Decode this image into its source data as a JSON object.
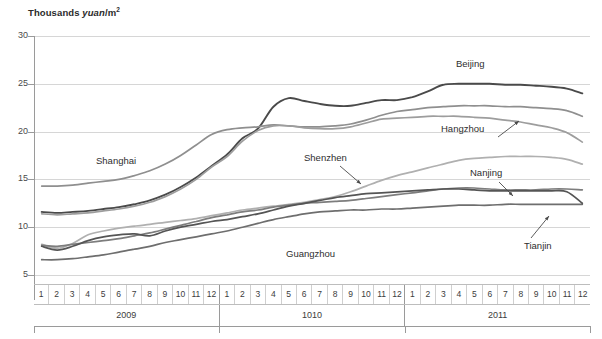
{
  "chart_data": {
    "type": "line",
    "title_parts": {
      "lead": "Thousands ",
      "italic": "yuan",
      "tail": "/m",
      "sup": "2"
    },
    "xlabel": "",
    "ylabel": "Thousands yuan/m2",
    "ylim": [
      5,
      30
    ],
    "yticks": [
      30,
      25,
      20,
      15,
      10,
      5
    ],
    "grid": true,
    "legend": "inline-annotations",
    "x_group_labels": [
      "2009",
      "1010",
      "2011"
    ],
    "x_month_labels": [
      "1",
      "2",
      "3",
      "4",
      "5",
      "6",
      "7",
      "8",
      "9",
      "10",
      "11",
      "12"
    ],
    "x": [
      "2009-1",
      "2009-2",
      "2009-3",
      "2009-4",
      "2009-5",
      "2009-6",
      "2009-7",
      "2009-8",
      "2009-9",
      "2009-10",
      "2009-11",
      "2009-12",
      "1010-1",
      "1010-2",
      "1010-3",
      "1010-4",
      "1010-5",
      "1010-6",
      "1010-7",
      "1010-8",
      "1010-9",
      "1010-10",
      "1010-11",
      "1010-12",
      "2011-1",
      "2011-2",
      "2011-3",
      "2011-4",
      "2011-5",
      "2011-6",
      "2011-7",
      "2011-8",
      "2011-9",
      "2011-10",
      "2011-11",
      "2011-12"
    ],
    "series": [
      {
        "name": "Beijing",
        "color": "#4a4a4a",
        "width": 1.9,
        "values": [
          11.6,
          11.5,
          11.6,
          11.7,
          11.9,
          12.1,
          12.4,
          12.8,
          13.4,
          14.2,
          15.2,
          16.4,
          17.6,
          19.3,
          20.3,
          22.6,
          23.5,
          23.2,
          22.9,
          22.7,
          22.7,
          23.0,
          23.3,
          23.3,
          23.6,
          24.2,
          24.9,
          25.0,
          25.0,
          25.0,
          24.9,
          24.9,
          24.8,
          24.7,
          24.5,
          24.0
        ]
      },
      {
        "name": "Shanghai",
        "color": "#8f8f8f",
        "width": 1.7,
        "values": [
          14.3,
          14.3,
          14.4,
          14.6,
          14.8,
          15.0,
          15.4,
          15.9,
          16.6,
          17.5,
          18.6,
          19.7,
          20.2,
          20.4,
          20.5,
          20.7,
          20.6,
          20.5,
          20.5,
          20.6,
          20.8,
          21.2,
          21.7,
          22.1,
          22.3,
          22.5,
          22.6,
          22.7,
          22.7,
          22.7,
          22.6,
          22.6,
          22.5,
          22.4,
          22.2,
          21.6
        ]
      },
      {
        "name": "Hangzhou",
        "color": "#9d9d9d",
        "width": 1.7,
        "values": [
          11.4,
          11.3,
          11.4,
          11.5,
          11.7,
          11.9,
          12.2,
          12.6,
          13.2,
          14.0,
          15.0,
          16.3,
          17.4,
          19.0,
          20.1,
          20.6,
          20.6,
          20.4,
          20.3,
          20.3,
          20.5,
          20.9,
          21.3,
          21.4,
          21.5,
          21.6,
          21.6,
          21.6,
          21.5,
          21.4,
          21.2,
          21.0,
          20.7,
          20.4,
          19.9,
          18.9
        ]
      },
      {
        "name": "Shenzhen",
        "color": "#b0b0b0",
        "width": 1.7,
        "values": [
          8.2,
          7.8,
          8.3,
          9.2,
          9.6,
          9.9,
          10.1,
          10.3,
          10.5,
          10.7,
          10.9,
          11.2,
          11.5,
          11.8,
          12.0,
          12.2,
          12.4,
          12.6,
          12.9,
          13.2,
          13.7,
          14.3,
          14.9,
          15.4,
          15.8,
          16.2,
          16.6,
          17.0,
          17.2,
          17.3,
          17.4,
          17.4,
          17.4,
          17.3,
          17.1,
          16.6
        ]
      },
      {
        "name": "Nanjing",
        "color": "#7d7d7d",
        "width": 1.7,
        "values": [
          8.1,
          8.0,
          8.2,
          8.4,
          8.6,
          8.8,
          9.1,
          9.4,
          9.8,
          10.2,
          10.6,
          11.0,
          11.3,
          11.6,
          11.8,
          12.1,
          12.3,
          12.5,
          12.6,
          12.7,
          12.8,
          13.0,
          13.2,
          13.4,
          13.6,
          13.8,
          14.0,
          14.1,
          14.1,
          14.0,
          13.9,
          13.9,
          13.9,
          14.0,
          14.0,
          13.9
        ]
      },
      {
        "name": "Guangzhou",
        "color": "#6e6e6e",
        "width": 1.7,
        "values": [
          6.6,
          6.6,
          6.7,
          6.9,
          7.1,
          7.4,
          7.7,
          8.0,
          8.4,
          8.7,
          9.0,
          9.3,
          9.6,
          10.0,
          10.4,
          10.8,
          11.1,
          11.4,
          11.6,
          11.7,
          11.8,
          11.8,
          11.9,
          11.9,
          12.0,
          12.1,
          12.2,
          12.3,
          12.3,
          12.3,
          12.4,
          12.4,
          12.4,
          12.4,
          12.4,
          12.4
        ]
      },
      {
        "name": "Tianjin",
        "color": "#555555",
        "width": 1.7,
        "values": [
          8.0,
          7.6,
          8.0,
          8.6,
          9.0,
          9.2,
          9.3,
          9.1,
          9.6,
          10.0,
          10.3,
          10.6,
          10.8,
          11.1,
          11.4,
          11.8,
          12.2,
          12.5,
          12.8,
          13.1,
          13.3,
          13.5,
          13.6,
          13.7,
          13.8,
          13.9,
          14.0,
          14.0,
          13.9,
          13.8,
          13.8,
          13.8,
          13.8,
          13.8,
          13.7,
          12.5
        ]
      }
    ],
    "annotations": [
      {
        "name": "Shanghai",
        "text": "Shanghai",
        "x": 96,
        "y": 155,
        "arrow": false
      },
      {
        "name": "Shenzhen",
        "text": "Shenzhen",
        "x": 304,
        "y": 152,
        "arrow": true,
        "arrow_from": [
          340,
          166
        ],
        "arrow_to": [
          361,
          184
        ]
      },
      {
        "name": "Beijing",
        "text": "Beijing",
        "x": 456,
        "y": 58,
        "arrow": false
      },
      {
        "name": "Hangzhou",
        "text": "Hangzhou",
        "x": 441,
        "y": 123,
        "arrow": true,
        "arrow_from": [
          498,
          137
        ],
        "arrow_to": [
          519,
          121
        ]
      },
      {
        "name": "Nanjing",
        "text": "Nanjing",
        "x": 470,
        "y": 167,
        "arrow": true,
        "arrow_from": [
          499,
          182
        ],
        "arrow_to": [
          513,
          196
        ]
      },
      {
        "name": "Guangzhou",
        "text": "Guangzhou",
        "x": 286,
        "y": 248,
        "arrow": false
      },
      {
        "name": "Tianjin",
        "text": "Tianjin",
        "x": 524,
        "y": 240,
        "arrow": true,
        "arrow_from": [
          531,
          238
        ],
        "arrow_to": [
          549,
          216
        ]
      }
    ]
  }
}
